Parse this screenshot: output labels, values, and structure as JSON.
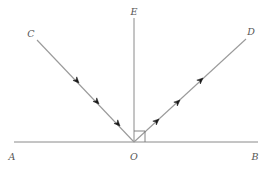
{
  "diagram": {
    "colors": {
      "line": "#8a8a8a",
      "arrow": "#1a1a1a",
      "label": "#555555",
      "background": "#ffffff"
    },
    "points": {
      "A": {
        "label": "A",
        "x": 12,
        "y": 160
      },
      "B": {
        "label": "B",
        "x": 255,
        "y": 160
      },
      "O": {
        "label": "O",
        "x": 134,
        "y": 160
      },
      "E": {
        "label": "E",
        "x": 134,
        "y": 15
      },
      "C": {
        "label": "C",
        "x": 31,
        "y": 37
      },
      "D": {
        "label": "D",
        "x": 251,
        "y": 35
      }
    },
    "segments": [
      {
        "id": "AB",
        "from": "A",
        "to": "B",
        "role": "mirror surface"
      },
      {
        "id": "OE",
        "from": "O",
        "to": "E",
        "role": "normal"
      },
      {
        "id": "CO",
        "from": "C",
        "to": "O",
        "role": "incident ray"
      },
      {
        "id": "OD",
        "from": "O",
        "to": "D",
        "role": "reflected ray"
      }
    ],
    "incident_arrows": 3,
    "reflected_arrows": 3,
    "right_angle_marker": "at O between OE and OB"
  }
}
